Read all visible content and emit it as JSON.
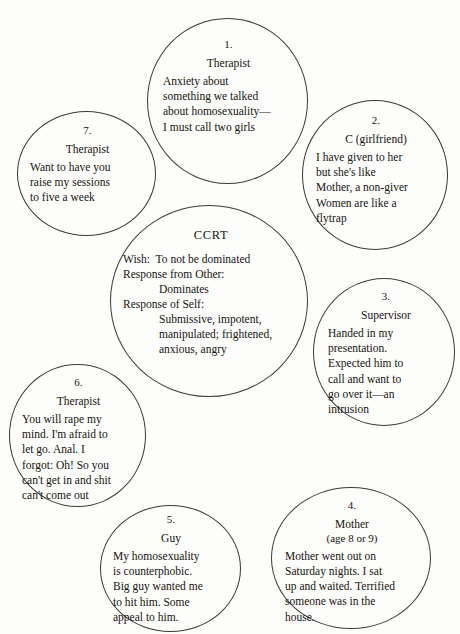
{
  "diagram": {
    "background_color": "#fdfdfb",
    "line_color": "#3a3a38"
  },
  "center": {
    "title": "CCRT",
    "wish_line": "Wish:  To not be dominated",
    "response_other_label": "Response from Other:",
    "response_other_value": "Dominates",
    "response_self_label": "Response of Self:",
    "response_self_value_1": "Submissive, impotent,",
    "response_self_value_2": "manipulated; frightened,",
    "response_self_value_3": "anxious, angry"
  },
  "nodes": [
    {
      "number": "1.",
      "role": "Therapist",
      "role_sub": "",
      "body": "Anxiety about\nsomething we talked\nabout homosexuality—\nI must call two girls"
    },
    {
      "number": "2.",
      "role": "C (girlfriend)",
      "role_sub": "",
      "body": "I have given to her\nbut she's like\nMother, a non-giver\nWomen are like a\nflytrap"
    },
    {
      "number": "3.",
      "role": "Supervisor",
      "role_sub": "",
      "body": "Handed in my\npresentation.\nExpected him to\ncall and want to\ngo over it—an\nintrusion"
    },
    {
      "number": "4.",
      "role": "Mother",
      "role_sub": "(age 8 or 9)",
      "body": "Mother went out on\nSaturday nights. I sat\nup and waited. Terrified\nsomeone was in the\nhouse."
    },
    {
      "number": "5.",
      "role": "Guy",
      "role_sub": "",
      "body": "My homosexuality\nis counterphobic.\nBig guy wanted me\nto hit him.  Some\nappeal to him."
    },
    {
      "number": "6.",
      "role": "Therapist",
      "role_sub": "",
      "body": "You will rape my\nmind. I'm afraid to\nlet go. Anal. I\nforgot: Oh! So you\ncan't get in and shit\ncan't come out"
    },
    {
      "number": "7.",
      "role": "Therapist",
      "role_sub": "",
      "body": "Want to have you\nraise my sessions\nto five a week"
    }
  ]
}
